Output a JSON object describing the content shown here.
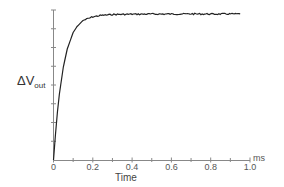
{
  "chart_data": {
    "type": "line",
    "title": "",
    "xlabel": "Time",
    "xunit": "ms",
    "ylabel_main": "ΔV",
    "ylabel_sub": "out",
    "xlim": [
      0,
      1.0
    ],
    "ylim": [
      0,
      1.0
    ],
    "x_ticks": [
      "0",
      "0.2",
      "0.4",
      "0.6",
      "0.8",
      "1.0"
    ],
    "x_minor_ticks": [
      0.1,
      0.3,
      0.5,
      0.7,
      0.9
    ],
    "y_ticks_count": 8,
    "y_tick_labels": [],
    "grid": false,
    "legend": null,
    "series": [
      {
        "name": "ΔVout step response",
        "description": "Exponential rise to plateau (~97% of axis height), time constant ~0.05 ms, slight noise on plateau, ends near 0.95 ms",
        "x": [
          0,
          0.01,
          0.02,
          0.03,
          0.05,
          0.07,
          0.1,
          0.12,
          0.15,
          0.2,
          0.25,
          0.3,
          0.4,
          0.5,
          0.6,
          0.7,
          0.8,
          0.95
        ],
        "y": [
          0,
          0.17,
          0.32,
          0.44,
          0.62,
          0.74,
          0.85,
          0.89,
          0.93,
          0.955,
          0.965,
          0.97,
          0.972,
          0.973,
          0.973,
          0.974,
          0.973,
          0.974
        ]
      }
    ]
  },
  "labels": {
    "ylabel_main": "ΔV",
    "ylabel_sub": "out",
    "xlabel": "Time",
    "xunit": "ms",
    "x_ticks": [
      "0",
      "0.2",
      "0.4",
      "0.6",
      "0.8",
      "1.0"
    ]
  }
}
